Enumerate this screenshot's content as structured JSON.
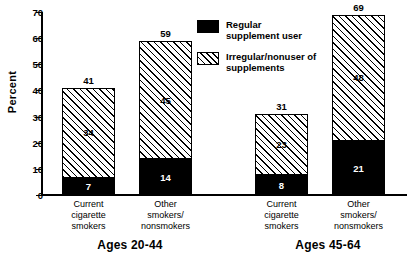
{
  "chart_data": {
    "type": "bar",
    "title": "",
    "xlabel": "",
    "ylabel": "Percent",
    "ylim": [
      0,
      70
    ],
    "ytick_step": 10,
    "yticks": [
      "0",
      "10",
      "20",
      "30",
      "40",
      "50",
      "60",
      "70"
    ],
    "grid": false,
    "stacked": true,
    "legend_position": "top-center-right",
    "groups": [
      {
        "name": "Ages 20-44",
        "categories": [
          "Current cigarette smokers",
          "Other smokers/ nonsmokers"
        ],
        "bars": [
          {
            "category_line1": "Current",
            "category_line2": "cigarette",
            "category_line3": "smokers",
            "total": 41,
            "regular": 7,
            "irregular": 34
          },
          {
            "category_line1": "Other",
            "category_line2": "smokers/",
            "category_line3": "nonsmokers",
            "total": 59,
            "regular": 14,
            "irregular": 45
          }
        ]
      },
      {
        "name": "Ages 45-64",
        "categories": [
          "Current cigarette smokers",
          "Other smokers/ nonsmokers"
        ],
        "bars": [
          {
            "category_line1": "Current",
            "category_line2": "cigarette",
            "category_line3": "smokers",
            "total": 31,
            "regular": 8,
            "irregular": 23
          },
          {
            "category_line1": "Other",
            "category_line2": "smokers/",
            "category_line3": "nonsmokers",
            "total": 69,
            "regular": 21,
            "irregular": 48
          }
        ]
      }
    ],
    "series": [
      {
        "name": "Regular supplement user",
        "color": "#000000",
        "fill": "solid",
        "values": [
          7,
          14,
          8,
          21
        ]
      },
      {
        "name": "Irregular/nonuser of supplements",
        "color": "#000000",
        "fill": "diagonal-hatch",
        "values": [
          34,
          45,
          23,
          48
        ]
      }
    ],
    "legend": [
      {
        "label_line1": "Regular",
        "label_line2": "supplement user",
        "swatch": "solid"
      },
      {
        "label_line1": "Irregular/nonuser of",
        "label_line2": "supplements",
        "swatch": "hatch"
      }
    ]
  },
  "axis": {
    "y_title": "Percent",
    "y_tick_0": "0",
    "y_tick_1": "10",
    "y_tick_2": "20",
    "y_tick_3": "30",
    "y_tick_4": "40",
    "y_tick_5": "50",
    "y_tick_6": "60",
    "y_tick_7": "70"
  }
}
